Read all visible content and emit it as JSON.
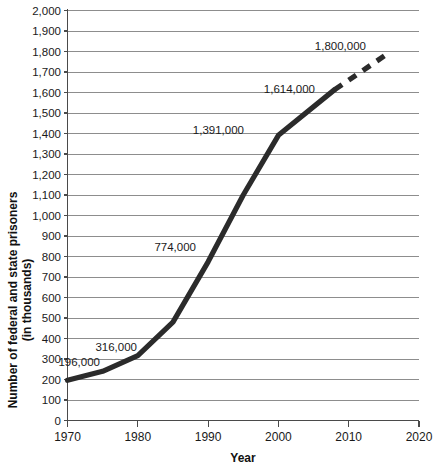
{
  "chart_data": {
    "type": "line",
    "title": "",
    "xlabel": "Year",
    "ylabel": "Number of federal and state prisoners\n(in thousands)",
    "ylabel_line1": "Number of federal and state prisoners",
    "ylabel_line2": "(in thousands)",
    "xlim": [
      1970,
      2020
    ],
    "ylim": [
      0,
      2000
    ],
    "grid": true,
    "legend": false,
    "x_ticks": [
      1970,
      1980,
      1990,
      2000,
      2010,
      2020
    ],
    "x_tick_labels": [
      "1970",
      "1980",
      "1990",
      "2000",
      "2010",
      "2020"
    ],
    "y_ticks": [
      0,
      100,
      200,
      300,
      400,
      500,
      600,
      700,
      800,
      900,
      1000,
      1100,
      1200,
      1300,
      1400,
      1500,
      1600,
      1700,
      1800,
      1900,
      2000
    ],
    "y_tick_labels": [
      "0",
      "100",
      "200",
      "300",
      "400",
      "500",
      "600",
      "700",
      "800",
      "900",
      "1,000",
      "1,100",
      "1,200",
      "1,300",
      "1,400",
      "1,500",
      "1,600",
      "1,700",
      "1,800",
      "1,900",
      "2,000"
    ],
    "series": [
      {
        "name": "Actual prisoners",
        "style": "solid",
        "x": [
          1970,
          1975,
          1980,
          1985,
          1990,
          1995,
          2000,
          2008
        ],
        "values": [
          196,
          240,
          316,
          480,
          774,
          1100,
          1391,
          1614
        ]
      },
      {
        "name": "Projected prisoners",
        "style": "dashed",
        "x": [
          2008,
          2016
        ],
        "values": [
          1614,
          1800
        ]
      }
    ],
    "annotations": [
      {
        "text": "196,000",
        "year": 1970,
        "value": 196,
        "label_x": 100,
        "label_y": 366
      },
      {
        "text": "316,000",
        "year": 1980,
        "value": 316,
        "label_x": 137,
        "label_y": 351
      },
      {
        "text": "774,000",
        "year": 1990,
        "value": 774,
        "label_x": 196,
        "label_y": 251
      },
      {
        "text": "1,391,000",
        "year": 2000,
        "value": 1391,
        "label_x": 244,
        "label_y": 134
      },
      {
        "text": "1,614,000",
        "year": 2008,
        "value": 1614,
        "label_x": 315,
        "label_y": 93
      },
      {
        "text": "1,800,000",
        "year": 2016,
        "value": 1800,
        "label_x": 366,
        "label_y": 50
      }
    ],
    "colors": {
      "series": "#2b2b2b",
      "gridline": "#8d8d8d",
      "axis": "#4a4a4a",
      "text": "#1a1a1a",
      "background": "#ffffff"
    }
  }
}
